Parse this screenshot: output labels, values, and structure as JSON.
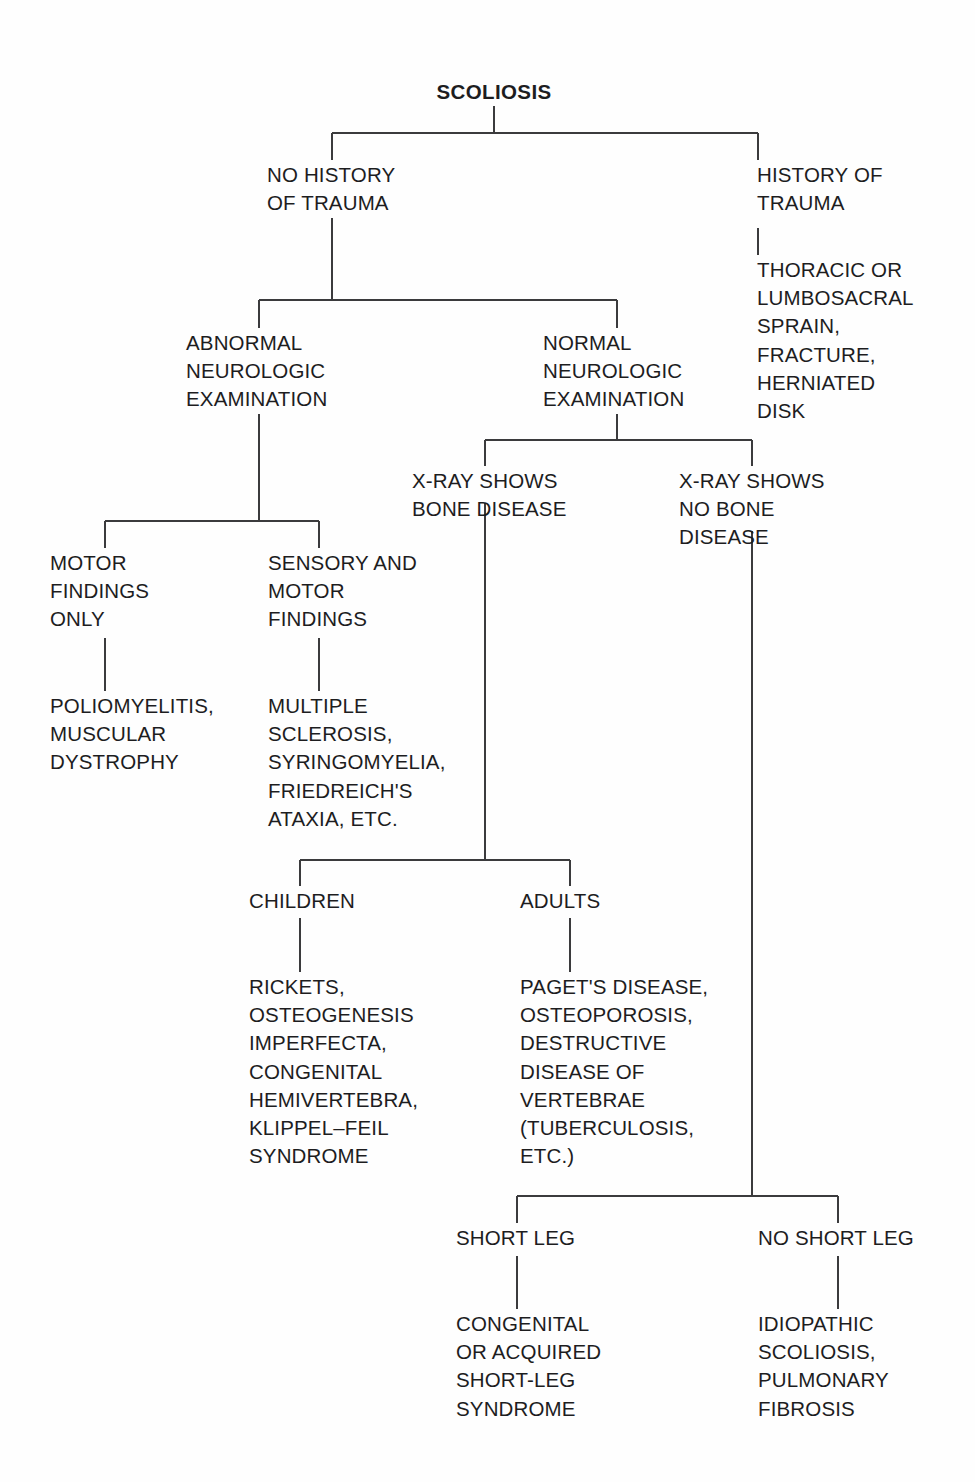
{
  "diagram": {
    "title": "SCOLIOSIS",
    "type": "clinical-differential-diagnosis-flowchart",
    "nodes": {
      "root": "SCOLIOSIS",
      "no_history_of_trauma": "NO HISTORY\nOF TRAUMA",
      "history_of_trauma": "HISTORY OF\nTRAUMA",
      "trauma_diagnoses": "THORACIC  OR\nLUMBOSACRAL\nSPRAIN,\nFRACTURE,\nHERNIATED\nDISK",
      "abnormal_neurologic_examination": "ABNORMAL\nNEUROLOGIC\nEXAMINATION",
      "normal_neurologic_examination": "NORMAL\nNEUROLOGIC\nEXAMINATION",
      "motor_findings_only": "MOTOR\nFINDINGS\nONLY",
      "motor_findings_only_diagnoses": "POLIOMYELITIS,\nMUSCULAR\nDYSTROPHY",
      "sensory_and_motor_findings": "SENSORY AND\nMOTOR\nFINDINGS",
      "sensory_and_motor_findings_diagnoses": "MULTIPLE\nSCLEROSIS,\nSYRINGOMYELIA,\nFRIEDREICH'S\nATAXIA, ETC.",
      "xray_shows_bone_disease": "X-RAY SHOWS\nBONE DISEASE",
      "xray_shows_no_bone_disease": "X-RAY SHOWS\nNO BONE\nDISEASE",
      "children": "CHILDREN",
      "children_diagnoses": "RICKETS,\nOSTEOGENESIS\nIMPERFECTA,\nCONGENITAL\nHEMIVERTEBRA,\nKLIPPEL–FEIL\nSYNDROME",
      "adults": "ADULTS",
      "adults_diagnoses": "PAGET'S DISEASE,\nOSTEOPOROSIS,\nDESTRUCTIVE\nDISEASE OF\nVERTEBRAE\n(TUBERCULOSIS,\nETC.)",
      "short_leg": "SHORT LEG",
      "short_leg_diagnoses": "CONGENITAL\nOR ACQUIRED\nSHORT-LEG\nSYNDROME",
      "no_short_leg": "NO SHORT LEG",
      "no_short_leg_diagnoses": "IDIOPATHIC\nSCOLIOSIS,\nPULMONARY\nFIBROSIS"
    },
    "colors": {
      "background": "#fefefe",
      "text": "#1d1d1f",
      "connector": "#3b3b3d"
    }
  }
}
